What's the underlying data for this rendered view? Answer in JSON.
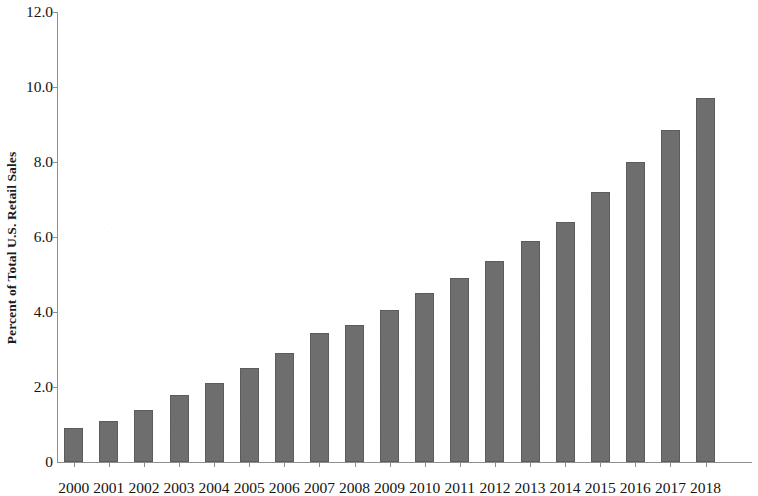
{
  "chart_data": {
    "type": "bar",
    "title": "",
    "subtitle": "",
    "xlabel": "",
    "ylabel": "Percent of Total U.S. Retail Sales",
    "categories": [
      "2000",
      "2001",
      "2002",
      "2003",
      "2004",
      "2005",
      "2006",
      "2007",
      "2008",
      "2009",
      "2010",
      "2011",
      "2012",
      "2013",
      "2014",
      "2015",
      "2016",
      "2017",
      "2018"
    ],
    "values": [
      0.9,
      1.1,
      1.4,
      1.8,
      2.1,
      2.5,
      2.9,
      3.45,
      3.65,
      4.05,
      4.5,
      4.9,
      5.35,
      5.9,
      6.4,
      7.2,
      8.0,
      8.85,
      9.7
    ],
    "ylim": [
      0,
      12
    ],
    "xlim_note": "categorical",
    "ytick_labels": [
      "12.0",
      "10.0",
      "8.0",
      "6.0",
      "4.0",
      "2.0",
      "0"
    ],
    "ytick_values": [
      12,
      10,
      8,
      6,
      4,
      2,
      0
    ],
    "grid": false,
    "legend": null,
    "legend_position": "none",
    "bar_color": "#6e6e6e",
    "axis_color": "#8e8e8e",
    "text_color": "#141414",
    "background_color": "#ffffff"
  },
  "axes": {
    "y_title": "Percent of Total U.S. Retail Sales"
  }
}
